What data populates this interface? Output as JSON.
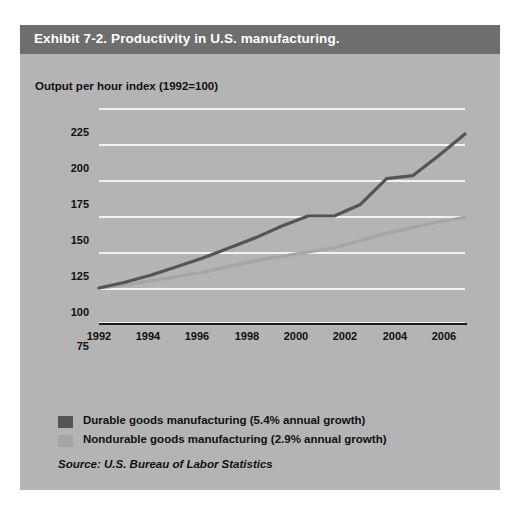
{
  "exhibit": {
    "title": "Exhibit 7-2. Productivity in U.S. manufacturing.",
    "source": "Source: U.S. Bureau of Labor Statistics"
  },
  "colors": {
    "panel_background": "#b4b4b4",
    "title_bar": "#6e6e6e",
    "title_text": "#ffffff",
    "gridline": "#f2f2f2",
    "axis": "#1c1c1c",
    "durable": "#555555",
    "nondurable": "#a5a5a5"
  },
  "chart_data": {
    "type": "line",
    "title": "Exhibit 7-2. Productivity in U.S. manufacturing.",
    "subtitle": "Output per hour index (1992=100)",
    "xlabel": "",
    "ylabel": "Output per hour index (1992=100)",
    "ylim": [
      75,
      225
    ],
    "xlim": [
      1992,
      2006
    ],
    "yticks": [
      225,
      200,
      175,
      150,
      125,
      100,
      75
    ],
    "xticks": [
      1992,
      1994,
      1996,
      1998,
      2000,
      2002,
      2004,
      2006
    ],
    "grid": true,
    "legend_position": "below-plot",
    "x": [
      1992,
      1993,
      1994,
      1995,
      1996,
      1997,
      1998,
      1999,
      2000,
      2001,
      2002,
      2003,
      2004,
      2005,
      2006
    ],
    "series": [
      {
        "name": "Durable goods manufacturing (5.4% annual growth)",
        "short_name": "Durable goods manufacturing",
        "annual_growth": "5.4%",
        "color": "#555555",
        "values": [
          100,
          104,
          109,
          115,
          121,
          128,
          135,
          143,
          150,
          150,
          158,
          176,
          178,
          192,
          207
        ]
      },
      {
        "name": "Nondurable goods manufacturing (2.9% annual growth)",
        "short_name": "Nondurable goods manufacturing",
        "annual_growth": "2.9%",
        "color": "#a5a5a5",
        "values": [
          100,
          102,
          105,
          108,
          111,
          115,
          119,
          122,
          125,
          128,
          133,
          138,
          142,
          146,
          149
        ]
      }
    ]
  },
  "legend": [
    {
      "label": "Durable goods manufacturing (5.4% annual growth)",
      "color": "#555555"
    },
    {
      "label": "Nondurable goods manufacturing (2.9% annual growth)",
      "color": "#a5a5a5"
    }
  ],
  "y_axis": {
    "labels": [
      "225",
      "200",
      "175",
      "150",
      "125",
      "100",
      "75"
    ]
  },
  "x_axis": {
    "labels": [
      "1992",
      "1994",
      "1996",
      "1998",
      "2000",
      "2002",
      "2004",
      "2006"
    ]
  }
}
